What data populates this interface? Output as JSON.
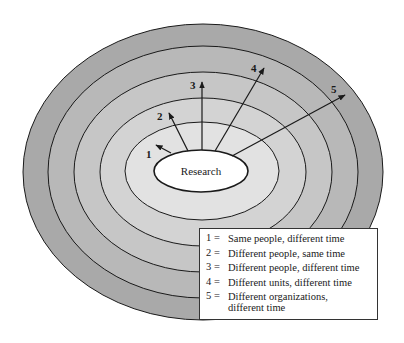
{
  "diagram": {
    "center_label": "Research",
    "colors": {
      "ring_outer": "#a9a9a9",
      "ring_2": "#b8b8b8",
      "ring_3": "#c6c6c6",
      "ring_4": "#d3d3d3",
      "ring_inner": "#e2e2e2",
      "center_fill": "#ffffff",
      "stroke": "#1a1a1a"
    },
    "rings": [
      {
        "cx": 203,
        "cy": 172,
        "rx": 180,
        "ry": 148
      },
      {
        "cx": 203,
        "cy": 172,
        "rx": 155,
        "ry": 126
      },
      {
        "cx": 203,
        "cy": 172,
        "rx": 129,
        "ry": 100
      },
      {
        "cx": 203,
        "cy": 172,
        "rx": 103,
        "ry": 74
      },
      {
        "cx": 202,
        "cy": 171,
        "rx": 77,
        "ry": 49
      }
    ],
    "arrows": [
      {
        "id": "1",
        "label": "1"
      },
      {
        "id": "2",
        "label": "2"
      },
      {
        "id": "3",
        "label": "3"
      },
      {
        "id": "4",
        "label": "4"
      },
      {
        "id": "5",
        "label": "5"
      }
    ]
  },
  "legend": {
    "items": [
      {
        "num": "1 =",
        "text": "Same people, different time"
      },
      {
        "num": "2 =",
        "text": "Different people, same time"
      },
      {
        "num": "3 =",
        "text": "Different people, different time"
      },
      {
        "num": "4 =",
        "text": "Different units, different time"
      },
      {
        "num": "5 =",
        "text": "Different organizations, different time"
      }
    ]
  }
}
